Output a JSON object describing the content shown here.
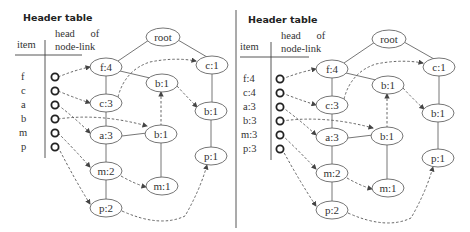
{
  "panels": [
    {
      "title": "Header table",
      "columns": {
        "item": "item",
        "head_line1": "head      of",
        "head_line2": "node-link"
      },
      "items": [
        "f",
        "c",
        "a",
        "b",
        "m",
        "p"
      ],
      "tree": {
        "root": "root",
        "nodes": [
          "f:4",
          "c:3",
          "a:3",
          "m:2",
          "p:2",
          "b:1",
          "b:1",
          "m:1",
          "c:1",
          "b:1",
          "p:1"
        ]
      }
    },
    {
      "title": "Header table",
      "columns": {
        "item": "item",
        "head_line1": "head      of",
        "head_line2": "node-link"
      },
      "items": [
        "f:4",
        "c:4",
        "a:3",
        "b:3",
        "m:3",
        "p:3"
      ],
      "tree": {
        "root": "root",
        "nodes": [
          "f:4",
          "c:3",
          "a:3",
          "m:2",
          "p:2",
          "b:1",
          "b:1",
          "m:1",
          "c:1",
          "b:1",
          "p:1"
        ]
      }
    }
  ],
  "colors": {
    "line": "#666666",
    "text": "#333333",
    "head_circle": "#222222"
  }
}
